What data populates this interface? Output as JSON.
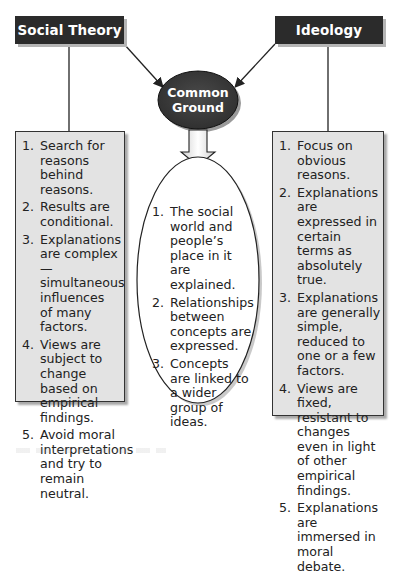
{
  "diagram": {
    "left_header": "Social Theory",
    "right_header": "Ideology",
    "center_node": {
      "line1": "Common",
      "line2": "Ground"
    },
    "social_theory_items": [
      {
        "num": "1.",
        "text": "Search for reasons behind reasons."
      },
      {
        "num": "2.",
        "text": "Results are conditional."
      },
      {
        "num": "3.",
        "text": "Explanations are complex— simultaneous influences of many factors."
      },
      {
        "num": "4.",
        "text": "Views are subject to change based on empirical findings."
      },
      {
        "num": "5.",
        "text": "Avoid moral interpretations and try to remain neutral."
      }
    ],
    "common_ground_items": [
      {
        "num": "1.",
        "text": "The social world and people’s place in it are explained."
      },
      {
        "num": "2.",
        "text": "Relationships between concepts are expressed."
      },
      {
        "num": "3.",
        "text": "Concepts are linked to a wider group of ideas."
      }
    ],
    "ideology_items": [
      {
        "num": "1.",
        "text": "Focus on obvious reasons."
      },
      {
        "num": "2.",
        "text": "Explanations are expressed in certain terms as absolutely true."
      },
      {
        "num": "3.",
        "text": "Explanations are generally simple, reduced to one or a few factors."
      },
      {
        "num": "4.",
        "text": "Views are fixed, resistant to changes even in light of other empirical findings."
      },
      {
        "num": "5.",
        "text": "Explanations are immersed in moral debate."
      }
    ]
  },
  "colors": {
    "header_fill": "#2b2b2b",
    "oval_fill": "#3a3a3a",
    "box_fill": "#e3e3e3",
    "line": "#222222"
  }
}
